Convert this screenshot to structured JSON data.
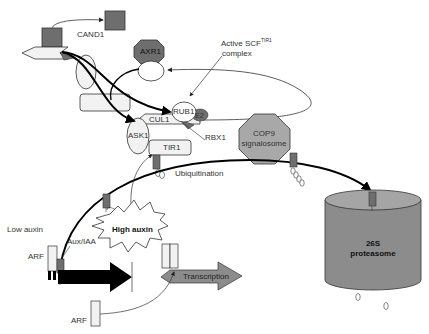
{
  "diagram": {
    "labels": {
      "cand1": "CAND1",
      "axr1": "AXR1",
      "active_scf_line1": "Active SCF",
      "active_scf_sup": "TIR1",
      "active_scf_line2": "complex",
      "rub1": "RUB1",
      "e2": "E2",
      "cul1": "CUL1",
      "rbx1": "RBX1",
      "ask1": "ASK1",
      "tir1": "TIR1",
      "cop9_line1": "COP9",
      "cop9_line2": "signalosome",
      "ubiquitination": "Ubiquitination",
      "low_auxin": "Low auxin",
      "high_auxin": "High auxin",
      "aux_iaa": "Aux/IAA",
      "arf_top": "ARF",
      "arf_bottom": "ARF",
      "transcription": "Transcription",
      "proteasome_line1": "26S",
      "proteasome_line2": "proteasome"
    },
    "colors": {
      "dark_gray": "#6e6e6e",
      "mid_gray": "#9a9a9a",
      "light_gray": "#f0f0f0",
      "proteasome": "#8c8c8c",
      "proteasome_top": "#a5a5a5",
      "stroke": "#333333",
      "arrow_black": "#000000"
    }
  }
}
